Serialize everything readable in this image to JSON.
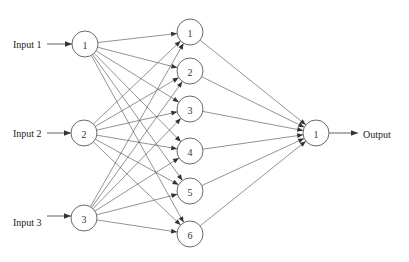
{
  "diagram": {
    "type": "neural-network",
    "layers": {
      "input": {
        "nodes": [
          {
            "label": "1",
            "x": 85,
            "y": 44
          },
          {
            "label": "2",
            "x": 84,
            "y": 133
          },
          {
            "label": "3",
            "x": 84,
            "y": 218
          }
        ]
      },
      "hidden": {
        "nodes": [
          {
            "label": "1",
            "x": 190,
            "y": 32
          },
          {
            "label": "2",
            "x": 190,
            "y": 71
          },
          {
            "label": "3",
            "x": 190,
            "y": 109
          },
          {
            "label": "4",
            "x": 190,
            "y": 151
          },
          {
            "label": "5",
            "x": 190,
            "y": 191
          },
          {
            "label": "6",
            "x": 190,
            "y": 234
          }
        ]
      },
      "output": {
        "nodes": [
          {
            "label": "1",
            "x": 316,
            "y": 133
          }
        ]
      }
    },
    "inputs": [
      {
        "label": "Input 1",
        "y": 44
      },
      {
        "label": "Input 2",
        "y": 133
      },
      {
        "label": "Input 3",
        "y": 216
      }
    ],
    "outputs": [
      {
        "label": "Output",
        "y": 133
      }
    ],
    "node_radius": 13,
    "connections": "fully-connected"
  }
}
